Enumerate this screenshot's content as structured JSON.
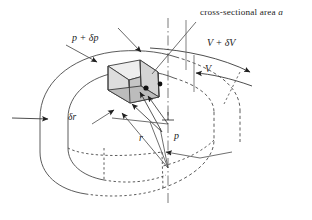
{
  "figure": {
    "title": "cross-sectional area a",
    "domain": "fluid-mechanics-annulus-element-diagram",
    "background_color": "#ffffff",
    "stroke_color": "#3a3a3a",
    "text_color": "#1c1c1c",
    "shade_light": "#e2e2e2",
    "shade_mid": "#c9c9c9",
    "shade_dark": "#b0b0b0"
  },
  "labels": {
    "cross_section": "cross-sectional area ",
    "cross_section_sym": "a",
    "pressure_outer": "p + δp",
    "velocity_outer": "V + δV",
    "velocity_inner": "V",
    "radial_thickness": "δr",
    "radius": "r",
    "pressure_inner": "p",
    "perpendicular": "⊥"
  }
}
